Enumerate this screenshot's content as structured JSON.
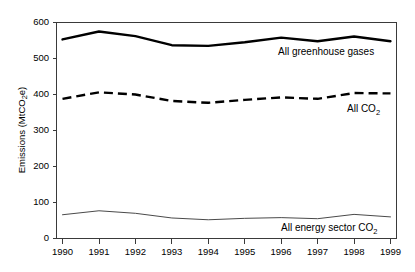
{
  "chart_data": {
    "type": "line",
    "title": "",
    "xlabel": "",
    "ylabel": "Emissions (MtCO2e)",
    "ylabel_base": "Emissions (MtCO",
    "ylabel_sub": "2",
    "ylabel_tail": "e)",
    "categories": [
      "1990",
      "1991",
      "1992",
      "1993",
      "1994",
      "1995",
      "1996",
      "1997",
      "1998",
      "1999"
    ],
    "x": [
      1990,
      1991,
      1992,
      1993,
      1994,
      1995,
      1996,
      1997,
      1998,
      1999
    ],
    "ylim": [
      0,
      600
    ],
    "xlim": [
      1990,
      1999
    ],
    "yticks": [
      0,
      100,
      200,
      300,
      400,
      500,
      600
    ],
    "ytick_labels": [
      "0",
      "100",
      "200",
      "300",
      "400",
      "500",
      "600"
    ],
    "grid": false,
    "legend_position": "inline-right",
    "series": [
      {
        "name": "All greenhouse gases",
        "label_base": "All greenhouse gases",
        "label_sub": "",
        "label_tail": "",
        "style": "solid-thick",
        "color": "#000000",
        "values": [
          553,
          575,
          562,
          537,
          535,
          545,
          558,
          548,
          561,
          548
        ]
      },
      {
        "name": "All CO2",
        "label_base": "All CO",
        "label_sub": "2",
        "label_tail": "",
        "style": "dashed-thick",
        "color": "#000000",
        "values": [
          388,
          406,
          400,
          382,
          377,
          385,
          392,
          388,
          404,
          403
        ]
      },
      {
        "name": "All energy sector CO2",
        "label_base": "All energy sector CO",
        "label_sub": "2",
        "label_tail": "",
        "style": "solid-thin",
        "color": "#4a4a4a",
        "values": [
          66,
          77,
          70,
          57,
          52,
          56,
          58,
          55,
          67,
          60
        ]
      }
    ],
    "annotations": []
  }
}
